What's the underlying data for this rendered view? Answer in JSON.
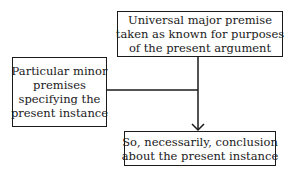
{
  "diagram": {
    "type": "flowchart",
    "nodes": {
      "major": {
        "id": "major-premise",
        "lines": [
          "Universal major premise",
          "taken as known for purposes",
          "of the present argument"
        ]
      },
      "minor": {
        "id": "minor-premises",
        "lines": [
          "Particular minor",
          "premises",
          "specifying the",
          "present instance"
        ]
      },
      "conclusion": {
        "id": "conclusion",
        "lines": [
          "So, necessarily, conclusion",
          "about the present instance"
        ]
      }
    },
    "edges": [
      {
        "from": "major-premise",
        "to": "conclusion",
        "style": "arrow"
      },
      {
        "from": "minor-premises",
        "to": "conclusion",
        "style": "joins-trunk"
      }
    ],
    "colors": {
      "line": "#1a1a1a",
      "background": "#ffffff"
    }
  }
}
